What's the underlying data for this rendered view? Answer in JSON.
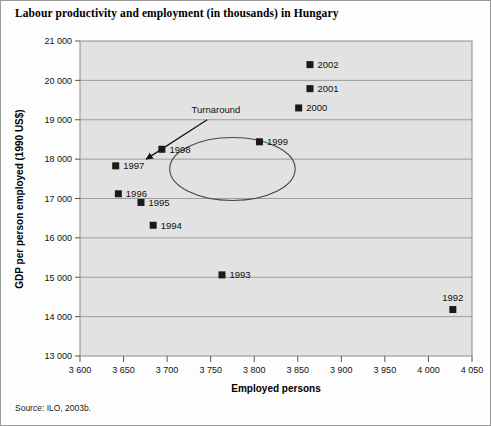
{
  "figure": {
    "title": "Labour productivity and employment (in thousands) in Hungary",
    "source": "Source: ILO, 2003b."
  },
  "chart_data": {
    "type": "scatter",
    "title": "Labour productivity and employment (in thousands) in Hungary",
    "xlabel": "Employed persons",
    "ylabel": "GDP per person employed (1990 US$)",
    "xlim": [
      3600,
      4050
    ],
    "ylim": [
      13000,
      21000
    ],
    "xticks": [
      3600,
      3650,
      3700,
      3750,
      3800,
      3850,
      3900,
      3950,
      4000,
      4050
    ],
    "xtick_labels": [
      "3 600",
      "3 650",
      "3 700",
      "3 750",
      "3 800",
      "3 850",
      "3 900",
      "3 950",
      "4 000",
      "4 050"
    ],
    "yticks": [
      13000,
      14000,
      15000,
      16000,
      17000,
      18000,
      19000,
      20000,
      21000
    ],
    "ytick_labels": [
      "13 000",
      "14 000",
      "15 000",
      "16 000",
      "17 000",
      "18 000",
      "19 000",
      "20 000",
      "21 000"
    ],
    "grid": "horizontal",
    "legend": "none",
    "marker_color": "#1a1a1a",
    "plot_bg": "#e2e2e2",
    "points": [
      {
        "label": "1992",
        "x": 4028,
        "y": 14180,
        "label_pos": "above"
      },
      {
        "label": "1993",
        "x": 3763,
        "y": 15060,
        "label_pos": "right"
      },
      {
        "label": "1994",
        "x": 3684,
        "y": 16320,
        "label_pos": "right"
      },
      {
        "label": "1995",
        "x": 3670,
        "y": 16900,
        "label_pos": "right"
      },
      {
        "label": "1996",
        "x": 3644,
        "y": 17120,
        "label_pos": "right"
      },
      {
        "label": "1997",
        "x": 3641,
        "y": 17830,
        "label_pos": "right"
      },
      {
        "label": "1998",
        "x": 3694,
        "y": 18250,
        "label_pos": "right"
      },
      {
        "label": "1999",
        "x": 3806,
        "y": 18440,
        "label_pos": "right"
      },
      {
        "label": "2000",
        "x": 3851,
        "y": 19300,
        "label_pos": "right"
      },
      {
        "label": "2001",
        "x": 3864,
        "y": 19790,
        "label_pos": "right"
      },
      {
        "label": "2002",
        "x": 3864,
        "y": 20400,
        "label_pos": "right"
      }
    ],
    "annotations": [
      {
        "name": "turnaround",
        "text": "Turnaround",
        "text_x": 3756,
        "text_y": 19180,
        "arrow_from_x": 3746,
        "arrow_from_y": 19000,
        "arrow_to_x": 3676,
        "arrow_to_y": 18000
      }
    ],
    "ellipse": {
      "name": "turnaround-highlight",
      "center_x": 3775,
      "center_y": 17750,
      "radius_x": 72,
      "radius_y": 800
    }
  }
}
